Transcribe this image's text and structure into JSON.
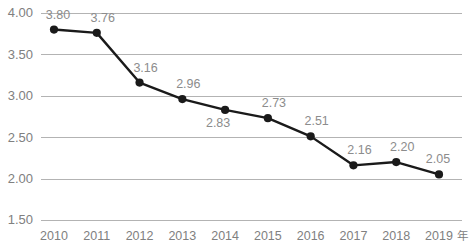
{
  "chart_data": {
    "type": "line",
    "title": "",
    "subtitle": "",
    "xlabel": "年",
    "ylabel": "",
    "categories": [
      "2010",
      "2011",
      "2012",
      "2013",
      "2014",
      "2015",
      "2016",
      "2017",
      "2018",
      "2019"
    ],
    "values": [
      3.8,
      3.76,
      3.16,
      2.96,
      2.83,
      2.73,
      2.51,
      2.16,
      2.2,
      2.05
    ],
    "point_labels": [
      "3.80",
      "3.76",
      "3.16",
      "2.96",
      "2.83",
      "2.73",
      "2.51",
      "2.16",
      "2.20",
      "2.05"
    ],
    "point_label_position": [
      "above",
      "above",
      "above",
      "above",
      "below",
      "above",
      "above",
      "above",
      "above",
      "above"
    ],
    "ylim": [
      1.5,
      4.0
    ],
    "ytick_values": [
      4.0,
      3.5,
      3.0,
      2.5,
      2.0,
      1.5
    ],
    "ytick_labels": [
      "4.00",
      "3.50",
      "3.00",
      "2.50",
      "2.00",
      "1.50"
    ],
    "xtick_labels": [
      "2010",
      "2011",
      "2012",
      "2013",
      "2014",
      "2015",
      "2016",
      "2017",
      "2018",
      "2019"
    ],
    "grid": "horizontal",
    "legend": "none",
    "series": [
      {
        "name": "",
        "values": [
          3.8,
          3.76,
          3.16,
          2.96,
          2.83,
          2.73,
          2.51,
          2.16,
          2.2,
          2.05
        ],
        "line_color": "#1a1a1a",
        "marker": "circle",
        "marker_color": "#1a1a1a"
      }
    ],
    "colors": {
      "line": "#1a1a1a",
      "marker": "#1a1a1a",
      "gridline": "#b3b3b3",
      "tick_text": "#808080",
      "value_label_text": "#8c8c8c",
      "background": "#ffffff"
    }
  }
}
